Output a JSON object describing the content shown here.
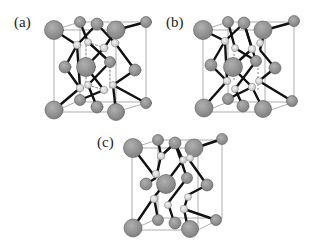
{
  "figure": {
    "panels": [
      {
        "id": "a",
        "label": "(a)"
      },
      {
        "id": "b",
        "label": "(b)"
      },
      {
        "id": "c",
        "label": "(c)"
      }
    ],
    "colors": {
      "large_atom": "#8f8f8f",
      "small_atom": "#d6d6d6",
      "bond": "#111111",
      "cell_edge": "#888888"
    }
  }
}
